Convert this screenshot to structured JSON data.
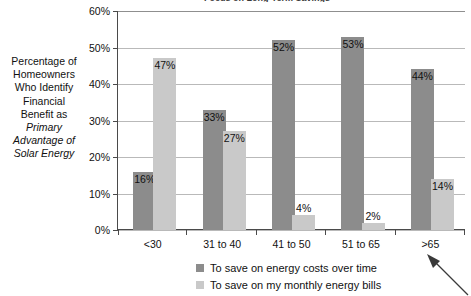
{
  "chart_data": {
    "type": "bar",
    "title": "Focus on Long-Term Savings",
    "xlabel": "",
    "ylabel": "Percentage of Homeowners Who Identify Financial Benefit as Primary Advantage of Solar Energy",
    "categories": [
      "<30",
      "31 to 40",
      "41 to 50",
      "51 to 65",
      ">65"
    ],
    "series": [
      {
        "name": "To save on energy costs over time",
        "color": "#8c8c8c",
        "values": [
          16,
          33,
          52,
          53,
          44
        ],
        "value_labels": [
          "16%",
          "33%",
          "52%",
          "53%",
          "44%"
        ]
      },
      {
        "name": "To save on my monthly energy bills",
        "color": "#c9c9c9",
        "values": [
          47,
          27,
          4,
          2,
          14
        ],
        "value_labels": [
          "47%",
          "27%",
          "4%",
          "2%",
          "14%"
        ]
      }
    ],
    "ylim": [
      0,
      60
    ],
    "yticks": [
      0,
      10,
      20,
      30,
      40,
      50,
      60
    ],
    "ytick_labels": [
      "0%",
      "10%",
      "20%",
      "30%",
      "40%",
      "50%",
      "60%"
    ],
    "grid": true,
    "legend_position": "bottom"
  },
  "axis_title": {
    "line1": "Percentage of",
    "line2": "Homeowners",
    "line3": "Who Identify",
    "line4": "Financial",
    "line5": "Benefit as",
    "line6": "Primary",
    "line7": "Advantage of",
    "line8": "Solar Energy"
  },
  "legend": {
    "item0": "To save on energy costs over time",
    "item1": "To save on my monthly energy bills"
  },
  "annotation": {
    "arrow_name": "callout-arrow"
  }
}
